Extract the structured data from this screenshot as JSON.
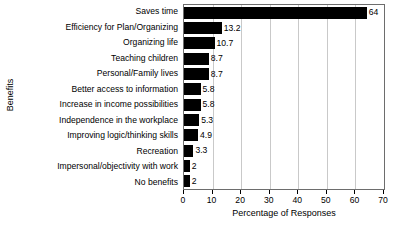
{
  "chart_data": {
    "type": "bar",
    "orientation": "horizontal",
    "title": "",
    "xlabel": "Percentage of Responses",
    "ylabel": "Benefits",
    "xlim": [
      0,
      70
    ],
    "xticks": [
      0,
      10,
      20,
      30,
      40,
      50,
      60,
      70
    ],
    "grid": "vertical",
    "legend": "none",
    "bar_color": "#000000",
    "categories": [
      "Saves time",
      "Efficiency for Plan/Organizing",
      "Organizing life",
      "Teaching children",
      "Personal/Family lives",
      "Better access to information",
      "Increase in income possibilities",
      "Independence in the workplace",
      "Improving logic/thinking skills",
      "Recreation",
      "Impersonal/objectivity with work",
      "No benefits"
    ],
    "values": [
      64,
      13.2,
      10.7,
      8.7,
      8.7,
      5.8,
      5.8,
      5.3,
      4.9,
      3.3,
      2,
      2
    ],
    "value_labels": [
      "64",
      "13.2",
      "10.7",
      "8.7",
      "8.7",
      "5.8",
      "5.8",
      "5.3",
      "4.9",
      "3.3",
      "2",
      "2"
    ]
  }
}
